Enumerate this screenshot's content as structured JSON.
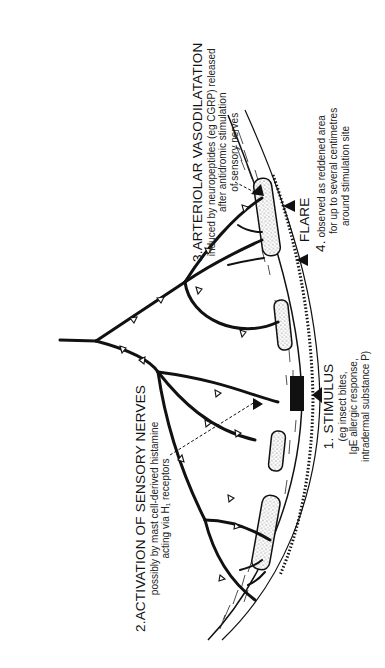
{
  "figure": {
    "orientation": "rotated -90deg (text reads bottom-to-top)",
    "labels": {
      "stimulus": {
        "heading": "1. STIMULUS",
        "lines": [
          "(eg insect bites,",
          "IgE allergic response,",
          "intradermal substance P)"
        ]
      },
      "activation": {
        "heading": "2.ACTIVATION OF SENSORY NERVES",
        "lines": [
          "possibly by mast cell-derived histamine",
          "acting via H₁ receptors"
        ]
      },
      "vasodilatation": {
        "heading": "3.ARTERIOLAR VASODILATATION",
        "lines": [
          "induced by neuropeptides (eg CGRP) released",
          "after antidromic stimulation",
          "of sensory nerves"
        ]
      },
      "flare": {
        "number": "4.",
        "heading": "FLARE",
        "lines": [
          "observed as reddened area",
          "for up to several centimetres",
          "around stimulation site"
        ]
      }
    },
    "elements": {
      "skin_surface": "epidermis band with hatched outer layer",
      "arterioles": 4,
      "nerve_tree": "branching sensory nerve with open arrowheads indicating antidromic conduction",
      "stimulus_marker": "black bar on skin surface with triangle pointer",
      "flare_markers": 2
    },
    "colors": {
      "ink": "#111111",
      "background": "#ffffff",
      "stipple": "#555555"
    }
  }
}
